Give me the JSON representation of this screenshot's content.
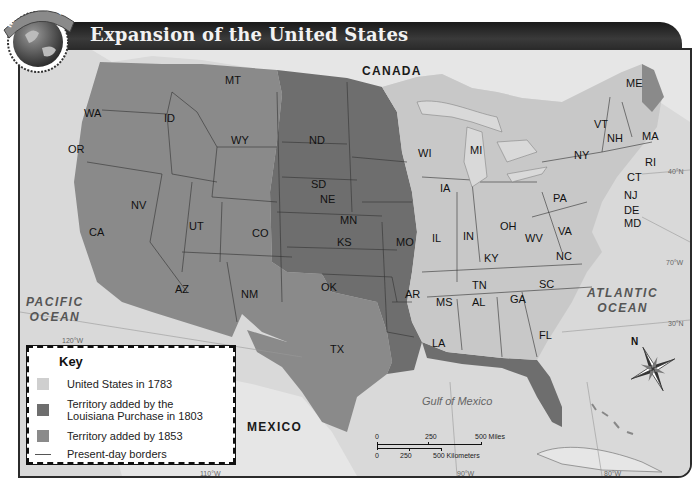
{
  "header": {
    "badge_text": "MAP SKILL",
    "title": "Expansion of the United States"
  },
  "colors": {
    "us_1783": "#c8c8c8",
    "louisiana_1803": "#6e6e6e",
    "added_by_1853": "#8a8a8a",
    "water": "#dadada",
    "foreign_land": "#e4e4e4",
    "title_bar": "#2a2a2a"
  },
  "regions": {
    "countries": [
      "CANADA",
      "MEXICO"
    ],
    "oceans": [
      {
        "line1": "PACIFIC",
        "line2": "OCEAN"
      },
      {
        "line1": "ATLANTIC",
        "line2": "OCEAN"
      }
    ],
    "gulf": "Gulf of Mexico"
  },
  "states": {
    "WA": "WA",
    "OR": "OR",
    "CA": "CA",
    "ID": "ID",
    "NV": "NV",
    "MT": "MT",
    "WY": "WY",
    "UT": "UT",
    "AZ": "AZ",
    "CO": "CO",
    "NM": "NM",
    "ND": "ND",
    "SD": "SD",
    "NE": "NE",
    "KS": "KS",
    "OK": "OK",
    "TX": "TX",
    "MN": "MN",
    "IA": "IA",
    "MO": "MO",
    "AR": "AR",
    "LA": "LA",
    "WI": "WI",
    "MI": "MI",
    "IL": "IL",
    "IN": "IN",
    "OH": "OH",
    "KY": "KY",
    "TN": "TN",
    "MS": "MS",
    "AL": "AL",
    "GA": "GA",
    "FL": "FL",
    "SC": "SC",
    "NC": "NC",
    "VA": "VA",
    "WV": "WV",
    "PA": "PA",
    "NY": "NY",
    "VT": "VT",
    "NH": "NH",
    "ME": "ME",
    "MA": "MA",
    "RI": "RI",
    "CT": "CT",
    "NJ": "NJ",
    "DE": "DE",
    "MD": "MD"
  },
  "grid_labels": {
    "lon_120": "120°W",
    "lon_110": "110°W",
    "lon_90": "90°W",
    "lon_80": "80°W",
    "lon_70": "70°W",
    "lat_40": "40°N",
    "lat_30": "30°N"
  },
  "key": {
    "title": "Key",
    "items": [
      {
        "label": "United States in 1783"
      },
      {
        "label_line1": "Territory added by the",
        "label_line2": "Louisiana Purchase in 1803"
      },
      {
        "label": "Territory added by 1853"
      },
      {
        "label": "Present-day borders"
      }
    ]
  },
  "scale_bar": {
    "miles": [
      "0",
      "250",
      "500 Miles"
    ],
    "kilometers": [
      "0",
      "250",
      "500 Kilometers"
    ]
  },
  "compass": {
    "north_label": "N"
  }
}
